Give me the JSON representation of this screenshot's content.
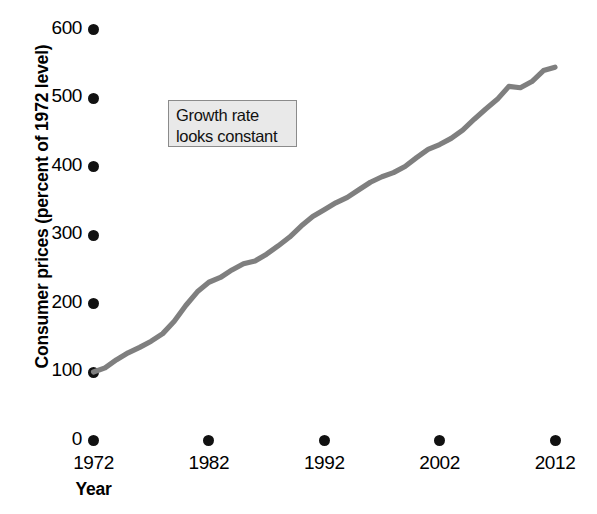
{
  "chart_data": {
    "type": "line",
    "title": "",
    "xlabel": "Year",
    "ylabel": "Consumer prices (percent of 1972 level)",
    "xlim": [
      1972,
      2013
    ],
    "ylim": [
      0,
      620
    ],
    "grid": false,
    "legend": "none",
    "line_color": "#7f7f7f",
    "x_ticks": [
      "1972",
      "1982",
      "1992",
      "2002",
      "2012"
    ],
    "x_tick_values": [
      1972,
      1982,
      1992,
      2002,
      2012
    ],
    "y_ticks": [
      "0",
      "100",
      "200",
      "300",
      "400",
      "500",
      "600"
    ],
    "y_tick_values": [
      0,
      100,
      200,
      300,
      400,
      500,
      600
    ],
    "series": [
      {
        "name": "Consumer prices (percent of 1972 level)",
        "x": [
          1972,
          1973,
          1974,
          1975,
          1976,
          1977,
          1978,
          1979,
          1980,
          1981,
          1982,
          1983,
          1984,
          1985,
          1986,
          1987,
          1988,
          1989,
          1990,
          1991,
          1992,
          1993,
          1994,
          1995,
          1996,
          1997,
          1998,
          1999,
          2000,
          2001,
          2002,
          2003,
          2004,
          2005,
          2006,
          2007,
          2008,
          2009,
          2010,
          2011,
          2012
        ],
        "values": [
          100,
          106,
          118,
          128,
          136,
          145,
          156,
          174,
          197,
          217,
          231,
          238,
          249,
          258,
          262,
          272,
          284,
          297,
          313,
          327,
          337,
          347,
          355,
          366,
          377,
          385,
          391,
          400,
          413,
          425,
          432,
          441,
          453,
          469,
          484,
          498,
          517,
          515,
          524,
          540,
          545
        ]
      }
    ],
    "annotations": [
      {
        "id": "growth-rate-note",
        "lines": [
          "Growth rate",
          "looks constant"
        ],
        "box_fill": "#e9e9e9",
        "box_border": "#8b8b8b"
      }
    ]
  },
  "axes": {
    "y_title": "Consumer prices (percent of 1972 level)",
    "x_title": "Year"
  }
}
